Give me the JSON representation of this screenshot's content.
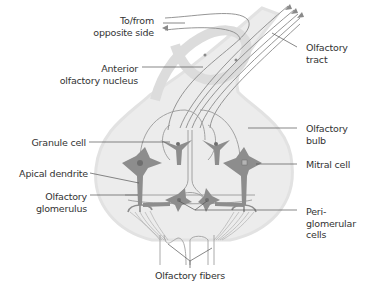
{
  "diagram": {
    "colors": {
      "bulb_fill": "#ececec",
      "bulb_outline": "#e2e2e2",
      "cell_fill": "#8d8d8d",
      "fiber_stroke": "#9a9a9a",
      "leader_line": "#555555",
      "text": "#333333"
    },
    "labels": {
      "to_from_opposite_side": [
        "To/from",
        "opposite side"
      ],
      "anterior_olfactory_nucleus": [
        "Anterior",
        "olfactory nucleus"
      ],
      "olfactory_tract": [
        "Olfactory",
        "tract"
      ],
      "olfactory_bulb": [
        "Olfactory",
        "bulb"
      ],
      "granule_cell": "Granule cell",
      "mitral_cell": "Mitral cell",
      "apical_dendrite": "Apical dendrite",
      "olfactory_glomerulus": [
        "Olfactory",
        "glomerulus"
      ],
      "periglomerular_cells": [
        "Peri-",
        "glomerular",
        "cells"
      ],
      "olfactory_fibers": "Olfactory fibers"
    }
  }
}
